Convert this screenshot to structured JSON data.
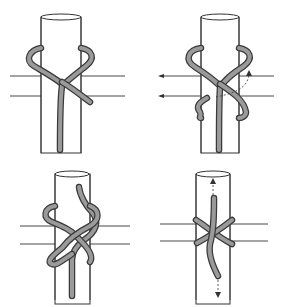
{
  "diagram": {
    "title": "",
    "panels": [
      {
        "step": 1,
        "position": "top-left",
        "content": "rope loops behind pole and crosses in front forming an X"
      },
      {
        "step": 2,
        "position": "top-right",
        "content": "second wrap with dashed arrow showing rope path behind pole; left-pointing arrows on horizontal lines"
      },
      {
        "step": 3,
        "position": "bottom-left",
        "content": "rope wrapped twice with end tucked up over top"
      },
      {
        "step": 4,
        "position": "bottom-right",
        "content": "knot tightened; dashed arrows up and down indicating pulling ends"
      }
    ],
    "colors": {
      "ink": "#333333",
      "rope": "#9a9a9a",
      "background": "#ffffff"
    }
  }
}
